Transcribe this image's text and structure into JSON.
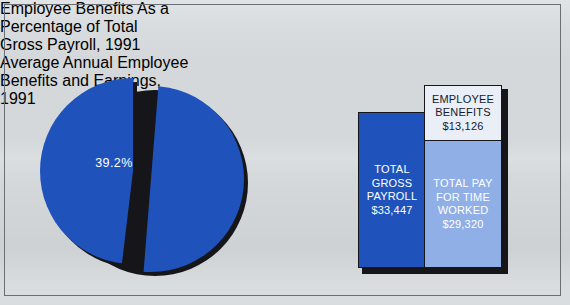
{
  "figure": {
    "background_color": "#d4d8db",
    "frame_color": "#6a6f74"
  },
  "colors": {
    "dark_blue": "#1f53bb",
    "light_blue": "#8fafe6",
    "white_panel": "#e9eef7",
    "shadow": "#16161a",
    "label_white": "#ffffff",
    "label_dark": "#141b2e"
  },
  "left_chart": {
    "title": "Employee Benefits As a Percentage of Total Gross Payroll, 1991",
    "title_lines": [
      "Employee Benefits As a",
      "Percentage of Total",
      "Gross Payroll, 1991"
    ],
    "slice_label": "39.2%"
  },
  "right_chart": {
    "title": "Average Annual Employee Benefits and Earnings, 1991",
    "title_lines": [
      "Average Annual Employee",
      "Benefits and Earnings,",
      "1991"
    ],
    "bars": {
      "gross_payroll": {
        "lines": [
          "TOTAL",
          "GROSS",
          "PAYROLL"
        ],
        "value_label": "$33,447"
      },
      "employee_benefits": {
        "lines": [
          "EMPLOYEE",
          "BENEFITS"
        ],
        "value_label": "$13,126"
      },
      "pay_time_worked": {
        "lines": [
          "TOTAL PAY",
          "FOR TIME",
          "WORKED"
        ],
        "value_label": "$29,320"
      }
    }
  },
  "chart_data": [
    {
      "type": "pie",
      "title": "Employee Benefits As a Percentage of Total Gross Payroll, 1991",
      "labels": [
        "Employee benefits",
        "Remainder of gross payroll"
      ],
      "values": [
        39.2,
        60.8
      ],
      "value_labels": [
        "39.2%",
        ""
      ],
      "units": "percent",
      "exploded_slice_index": 0,
      "colors": [
        "#1f53bb",
        "#1f53bb"
      ],
      "legend": "none",
      "annotations": [
        "39.2%"
      ]
    },
    {
      "type": "bar",
      "title": "Average Annual Employee Benefits and Earnings, 1991",
      "categories": [
        "Total gross payroll",
        "Earnings breakdown"
      ],
      "stacked": true,
      "units": "US dollars per employee per year",
      "xlabel": "",
      "ylabel": "",
      "ylim": [
        0,
        33447
      ],
      "grid": false,
      "legend": "none",
      "series": [
        {
          "name": "Total gross payroll",
          "values": [
            33447,
            null
          ],
          "value_labels": [
            "$33,447",
            ""
          ],
          "color": "#1f53bb"
        },
        {
          "name": "Total pay for time worked",
          "values": [
            null,
            29320
          ],
          "value_labels": [
            "",
            "$29,320"
          ],
          "color": "#8fafe6"
        },
        {
          "name": "Employee benefits",
          "values": [
            null,
            13126
          ],
          "value_labels": [
            "",
            "$13,126"
          ],
          "color": "#e9eef7"
        }
      ]
    }
  ]
}
